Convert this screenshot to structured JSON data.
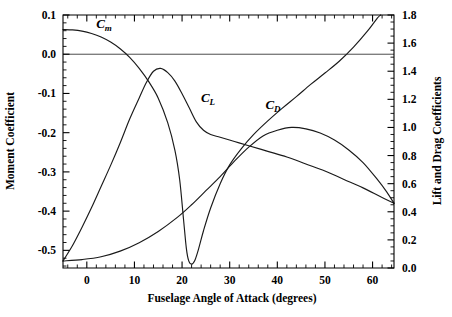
{
  "chart_data": {
    "type": "line",
    "title": "",
    "xlabel": "Fuselage Angle of Attack (degrees)",
    "ylabel": "Moment Coefficient",
    "y2label": "Lift and Drag Coefficients",
    "xlim": [
      -5,
      64.5
    ],
    "ylim": [
      -0.545,
      0.1
    ],
    "y2lim": [
      0.0,
      1.8
    ],
    "xticks": [
      0,
      10,
      20,
      30,
      40,
      50,
      60
    ],
    "xticklabels": [
      "0",
      "10",
      "20",
      "30",
      "40",
      "50",
      "60"
    ],
    "xminor_step": 2,
    "yticks": [
      0.1,
      0.0,
      -0.1,
      -0.2,
      -0.3,
      -0.4,
      -0.5
    ],
    "yticklabels": [
      "0.1",
      "0.0",
      "-0.1",
      "-0.2",
      "-0.3",
      "-0.4",
      "-0.5"
    ],
    "yminor_step": 0.02,
    "y2ticks": [
      1.8,
      1.6,
      1.4,
      1.2,
      1.0,
      0.8,
      0.6,
      0.4,
      0.2,
      0.0
    ],
    "y2ticklabels": [
      "1.8",
      "1.6",
      "1.4",
      "1.2",
      "1.0",
      "0.8",
      "0.6",
      "0.4",
      "0.2",
      "0.0"
    ],
    "y2minor_step": 0.05,
    "grid": false,
    "legend": "inline-annotations",
    "zero_line_y": 0.0,
    "series": [
      {
        "name": "Cm",
        "label_main": "C",
        "label_sub": "m",
        "axis": "left",
        "label_x": 2.0,
        "label_y": 0.068,
        "points": [
          [
            -5.0,
            0.063
          ],
          [
            -3.0,
            0.062
          ],
          [
            -1.0,
            0.059
          ],
          [
            1.0,
            0.053
          ],
          [
            3.0,
            0.044
          ],
          [
            5.0,
            0.031
          ],
          [
            7.0,
            0.014
          ],
          [
            9.0,
            -0.008
          ],
          [
            11.0,
            -0.036
          ],
          [
            13.0,
            -0.07
          ],
          [
            15.0,
            -0.112
          ],
          [
            17.0,
            -0.175
          ],
          [
            18.5,
            -0.245
          ],
          [
            19.5,
            -0.32
          ],
          [
            20.3,
            -0.42
          ],
          [
            20.9,
            -0.495
          ],
          [
            21.4,
            -0.527
          ],
          [
            22.0,
            -0.535
          ],
          [
            22.7,
            -0.525
          ],
          [
            23.5,
            -0.495
          ],
          [
            24.5,
            -0.45
          ],
          [
            26.0,
            -0.392
          ],
          [
            28.0,
            -0.33
          ],
          [
            30.0,
            -0.282
          ],
          [
            32.5,
            -0.24
          ],
          [
            35.0,
            -0.205
          ],
          [
            38.0,
            -0.17
          ],
          [
            41.0,
            -0.138
          ],
          [
            44.0,
            -0.108
          ],
          [
            47.0,
            -0.077
          ],
          [
            50.0,
            -0.048
          ],
          [
            53.0,
            -0.018
          ],
          [
            56.0,
            0.018
          ],
          [
            59.0,
            0.06
          ],
          [
            61.0,
            0.092
          ],
          [
            61.7,
            0.1
          ]
        ]
      },
      {
        "name": "CL",
        "label_main": "C",
        "label_sub": "L",
        "axis": "right",
        "label_x": 24.0,
        "label_y": 1.18,
        "points": [
          [
            -5.0,
            0.05
          ],
          [
            -3.0,
            0.16
          ],
          [
            -1.0,
            0.29
          ],
          [
            1.0,
            0.43
          ],
          [
            3.0,
            0.58
          ],
          [
            5.0,
            0.73
          ],
          [
            7.0,
            0.89
          ],
          [
            9.0,
            1.06
          ],
          [
            11.0,
            1.21
          ],
          [
            12.5,
            1.32
          ],
          [
            14.0,
            1.4
          ],
          [
            15.5,
            1.42
          ],
          [
            17.0,
            1.39
          ],
          [
            18.5,
            1.33
          ],
          [
            20.0,
            1.24
          ],
          [
            21.5,
            1.14
          ],
          [
            23.0,
            1.04
          ],
          [
            24.5,
            0.98
          ],
          [
            26.0,
            0.95
          ],
          [
            28.0,
            0.93
          ],
          [
            31.0,
            0.9
          ],
          [
            34.0,
            0.87
          ],
          [
            38.0,
            0.83
          ],
          [
            42.0,
            0.79
          ],
          [
            46.0,
            0.74
          ],
          [
            50.0,
            0.69
          ],
          [
            54.0,
            0.63
          ],
          [
            58.0,
            0.57
          ],
          [
            61.5,
            0.51
          ],
          [
            64.5,
            0.46
          ]
        ]
      },
      {
        "name": "CD",
        "label_main": "C",
        "label_sub": "D",
        "axis": "right",
        "label_x": 37.5,
        "label_y": 1.13,
        "points": [
          [
            -5.0,
            0.05
          ],
          [
            -1.0,
            0.06
          ],
          [
            3.0,
            0.08
          ],
          [
            7.0,
            0.12
          ],
          [
            11.0,
            0.18
          ],
          [
            15.0,
            0.26
          ],
          [
            19.0,
            0.36
          ],
          [
            22.0,
            0.45
          ],
          [
            25.0,
            0.55
          ],
          [
            28.0,
            0.65
          ],
          [
            31.0,
            0.76
          ],
          [
            34.0,
            0.86
          ],
          [
            37.0,
            0.94
          ],
          [
            40.0,
            0.98
          ],
          [
            43.0,
            1.0
          ],
          [
            46.0,
            0.99
          ],
          [
            49.0,
            0.96
          ],
          [
            52.0,
            0.91
          ],
          [
            55.0,
            0.84
          ],
          [
            58.0,
            0.75
          ],
          [
            61.0,
            0.63
          ],
          [
            63.0,
            0.54
          ],
          [
            64.5,
            0.46
          ]
        ]
      }
    ]
  },
  "axes": {
    "x_title": "Fuselage Angle of Attack (degrees)",
    "y_left_title": "Moment Coefficient",
    "y_right_title": "Lift and Drag Coefficients"
  },
  "colors": {
    "curve": "#1a1a1a",
    "axis": "#000000",
    "zero_line": "#4d4d4d",
    "background": "#ffffff"
  }
}
